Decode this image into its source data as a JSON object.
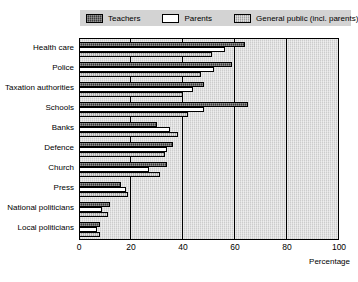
{
  "legend": {
    "entries": [
      {
        "label": "Teachers",
        "key": "teachers",
        "color": "#3a3a3a"
      },
      {
        "label": "Parents",
        "key": "parents",
        "color": "#ffffff"
      },
      {
        "label": "General public (incl. parents)",
        "key": "general",
        "color": "#b9b9b9"
      }
    ]
  },
  "axis": {
    "x_title": "Percentage",
    "x_ticks": [
      "0",
      "20",
      "40",
      "60",
      "80",
      "100"
    ]
  },
  "chart_data": {
    "type": "bar",
    "orientation": "horizontal",
    "title": "",
    "subtitle": "",
    "xlabel": "Percentage",
    "ylabel": "",
    "xlim": [
      0,
      100
    ],
    "xticks": [
      0,
      20,
      40,
      60,
      80,
      100
    ],
    "grid": true,
    "legend_position": "top",
    "categories": [
      "Health care",
      "Police",
      "Taxation authorities",
      "Schools",
      "Banks",
      "Defence",
      "Church",
      "Press",
      "National politicians",
      "Local politicians"
    ],
    "series": [
      {
        "name": "Teachers",
        "color": "#3a3a3a",
        "values": [
          64,
          59,
          48,
          65,
          30,
          36,
          34,
          16,
          12,
          8
        ]
      },
      {
        "name": "Parents",
        "color": "#ffffff",
        "values": [
          56,
          52,
          44,
          48,
          35,
          34,
          27,
          18,
          9,
          7
        ]
      },
      {
        "name": "General public (incl. parents)",
        "color": "#b9b9b9",
        "values": [
          51,
          47,
          40,
          42,
          38,
          33,
          31,
          19,
          11,
          8
        ]
      }
    ]
  }
}
